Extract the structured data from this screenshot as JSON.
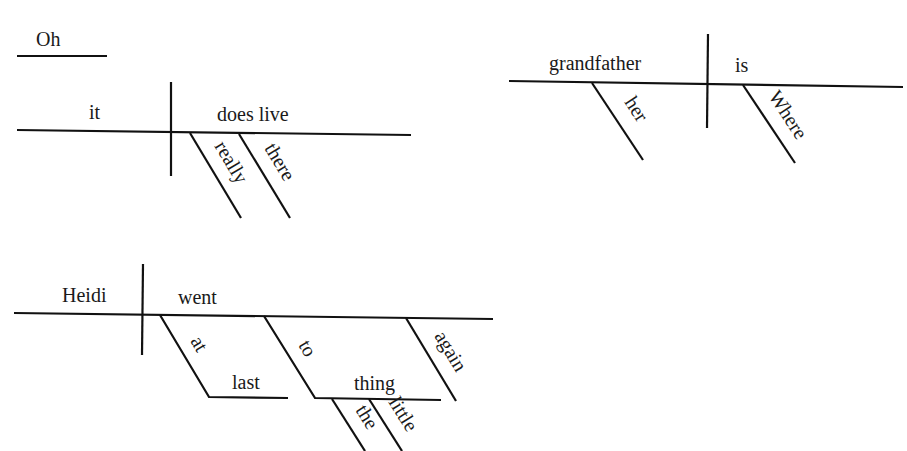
{
  "diagram": {
    "type": "sentence-diagram",
    "colors": {
      "line": "#111111",
      "text": "#1a1a1a",
      "background": "#ffffff"
    },
    "interjection": {
      "word": "Oh"
    },
    "clause1": {
      "subject": "it",
      "verb": "does live",
      "modifiers": [
        "really",
        "there"
      ]
    },
    "clause2": {
      "subject": "grandfather",
      "subject_modifier": "her",
      "verb": "is",
      "verb_modifier": "Where"
    },
    "clause3": {
      "subject": "Heidi",
      "verb": "went",
      "phrase1": {
        "preposition": "at",
        "object": "last"
      },
      "phrase2": {
        "preposition": "to",
        "object": "thing",
        "object_modifiers": [
          "the",
          "little"
        ]
      },
      "adverb": "again"
    }
  }
}
